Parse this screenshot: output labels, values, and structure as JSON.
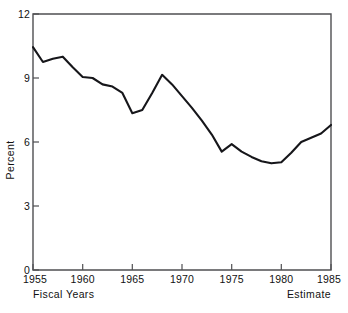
{
  "chart_data": {
    "type": "line",
    "title": "",
    "subtitle": "",
    "xlabel": "Fiscal Years",
    "ylabel": "Percent",
    "xlim": [
      1955,
      1985
    ],
    "ylim": [
      0,
      12
    ],
    "grid": false,
    "legend": "none",
    "x_ticks": [
      "1955",
      "1960",
      "1965",
      "1970",
      "1975",
      "1980",
      "1985"
    ],
    "x_tick_values": [
      1955,
      1960,
      1965,
      1970,
      1975,
      1980,
      1985
    ],
    "y_ticks": [
      "0",
      "3",
      "6",
      "9",
      "12"
    ],
    "y_tick_values": [
      0,
      3,
      6,
      9,
      12
    ],
    "annotations": [
      {
        "name": "fiscal-years-note",
        "text": "Fiscal Years",
        "position": "below-axis-left"
      },
      {
        "name": "estimate-note",
        "text": "Estimate",
        "position": "below-axis-right"
      }
    ],
    "x": [
      1955,
      1956,
      1957,
      1958,
      1959,
      1960,
      1961,
      1962,
      1963,
      1964,
      1965,
      1966,
      1967,
      1968,
      1969,
      1970,
      1971,
      1972,
      1973,
      1974,
      1975,
      1976,
      1977,
      1978,
      1979,
      1980,
      1981,
      1982,
      1983,
      1984,
      1985
    ],
    "values": [
      10.45,
      9.75,
      9.9,
      10.0,
      9.5,
      9.05,
      9.0,
      8.7,
      8.6,
      8.3,
      7.35,
      7.5,
      8.3,
      9.15,
      8.7,
      8.15,
      7.6,
      7.0,
      6.35,
      5.55,
      5.9,
      5.55,
      5.3,
      5.1,
      5.0,
      5.05,
      5.5,
      6.0,
      6.2,
      6.4,
      6.8
    ],
    "series": [
      {
        "name": "Percent",
        "color": "#16161a",
        "values": [
          10.45,
          9.75,
          9.9,
          10.0,
          9.5,
          9.05,
          9.0,
          8.7,
          8.6,
          8.3,
          7.35,
          7.5,
          8.3,
          9.15,
          8.7,
          8.15,
          7.6,
          7.0,
          6.35,
          5.55,
          5.9,
          5.55,
          5.3,
          5.1,
          5.0,
          5.05,
          5.5,
          6.0,
          6.2,
          6.4,
          6.8
        ]
      }
    ]
  },
  "axes": {
    "y_label": "Percent",
    "y_tick_0": "0",
    "y_tick_1": "3",
    "y_tick_2": "6",
    "y_tick_3": "9",
    "y_tick_4": "12",
    "x_tick_0": "1955",
    "x_tick_1": "1960",
    "x_tick_2": "1965",
    "x_tick_3": "1970",
    "x_tick_4": "1975",
    "x_tick_5": "1980",
    "x_tick_6": "1985"
  },
  "captions": {
    "left": "Fiscal Years",
    "right": "Estimate"
  },
  "colors": {
    "line": "#16161a",
    "frame": "#4f4f52",
    "background": "#ffffff",
    "text": "#111111"
  }
}
